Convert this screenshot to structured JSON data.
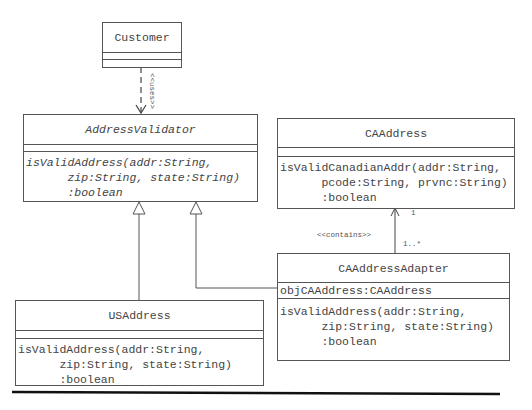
{
  "classes": {
    "customer": {
      "name": "Customer",
      "attributes": [],
      "operations": []
    },
    "address_validator": {
      "name": "AddressValidator",
      "abstract": true,
      "attributes": [],
      "operation": "isValidAddress(addr:String,\n      zip:String, state:String)\n      :boolean"
    },
    "ca_address": {
      "name": "CAAddress",
      "attributes": [],
      "operation": "isValidCanadianAddr(addr:String,\n      pcode:String, prvnc:String)\n      :boolean"
    },
    "ca_address_adapter": {
      "name": "CAAddressAdapter",
      "attribute": "objCAAddress:CAAddress",
      "operation": "isValidAddress(addr:String,\n      zip:String, state:String)\n      :boolean"
    },
    "us_address": {
      "name": "USAddress",
      "attributes": [],
      "operation": "isValidAddress(addr:String,\n      zip:String, state:String)\n      :boolean"
    }
  },
  "relationships": {
    "uses": {
      "from": "Customer",
      "to": "AddressValidator",
      "type": "dependency",
      "label": "<<uses>>"
    },
    "us_generalization": {
      "from": "USAddress",
      "to": "AddressValidator",
      "type": "generalization"
    },
    "adapter_generalization": {
      "from": "CAAddressAdapter",
      "to": "AddressValidator",
      "type": "generalization"
    },
    "contains": {
      "from": "CAAddressAdapter",
      "to": "CAAddress",
      "type": "association",
      "label": "<<contains>>",
      "target_multiplicity": "1",
      "source_multiplicity": "1..*"
    }
  }
}
